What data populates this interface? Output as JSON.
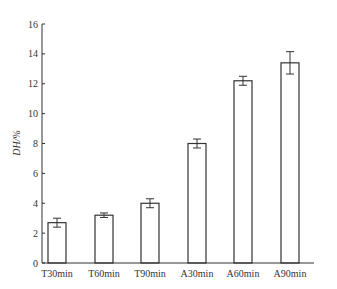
{
  "chart_data": {
    "type": "bar",
    "title": "",
    "xlabel": "",
    "ylabel": "DH/%",
    "ylim": [
      0,
      16
    ],
    "yticks": [
      0,
      2,
      4,
      6,
      8,
      10,
      12,
      14,
      16
    ],
    "grid": false,
    "legend": null,
    "categories": [
      "T30min",
      "T60min",
      "T90min",
      "A30min",
      "A60min",
      "A90min"
    ],
    "values": [
      2.7,
      3.2,
      4.0,
      8.0,
      12.2,
      13.4
    ],
    "error": [
      0.3,
      0.15,
      0.3,
      0.3,
      0.3,
      0.75
    ],
    "bar_fill": "#ffffff",
    "bar_stroke": "#333333"
  }
}
